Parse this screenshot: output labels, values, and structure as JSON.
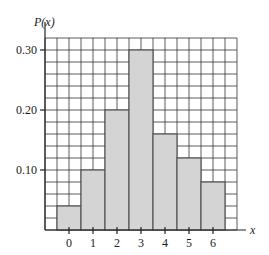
{
  "chart_data": {
    "type": "bar",
    "title": "",
    "xlabel": "x",
    "ylabel": "P(x)",
    "categories": [
      "0",
      "1",
      "2",
      "3",
      "4",
      "5",
      "6"
    ],
    "values": [
      0.04,
      0.1,
      0.2,
      0.3,
      0.16,
      0.12,
      0.08
    ],
    "ylim": [
      0,
      0.32
    ],
    "yticks": [
      0.1,
      0.2,
      0.3
    ],
    "ytick_labels": [
      "0.10",
      "0.20",
      "0.30"
    ],
    "grid": true,
    "grid_step_y": 0.02,
    "bar_width": 1,
    "legend": null
  },
  "colors": {
    "bar_fill": "#d4d4d4",
    "bar_stroke": "#555555",
    "grid": "#333333",
    "axis": "#222222",
    "background": "#ffffff"
  }
}
